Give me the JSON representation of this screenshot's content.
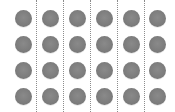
{
  "grid": {
    "rows": 4,
    "columns": 6,
    "dot_color": "#7c7c7c",
    "divider_color": "#8c8c8c",
    "column_centers": [
      23,
      50,
      77,
      104,
      131,
      157
    ],
    "row_centers": [
      18,
      44,
      70,
      96
    ],
    "divider_positions": [
      36,
      63,
      90,
      117,
      144
    ]
  }
}
